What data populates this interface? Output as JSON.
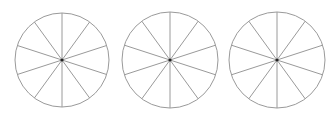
{
  "diagram": {
    "stroke_color": "#9a9a9a",
    "center_dot_color": "#222222",
    "circles": [
      {
        "cx": 62,
        "cy": 60,
        "r": 47,
        "sectors": 10
      },
      {
        "cx": 170,
        "cy": 60,
        "r": 48,
        "sectors": 10
      },
      {
        "cx": 277,
        "cy": 60,
        "r": 48,
        "sectors": 10
      }
    ]
  }
}
